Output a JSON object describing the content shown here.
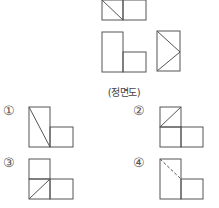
{
  "problem": {
    "caption": "(정면도)",
    "options": [
      {
        "number": "①",
        "label_pos": [
          3,
          103
        ]
      },
      {
        "number": "②",
        "label_pos": [
          133,
          103
        ]
      },
      {
        "number": "③",
        "label_pos": [
          3,
          155
        ]
      },
      {
        "number": "④",
        "label_pos": [
          133,
          155
        ]
      }
    ]
  },
  "colors": {
    "line": "#555555",
    "background": "#ffffff"
  }
}
